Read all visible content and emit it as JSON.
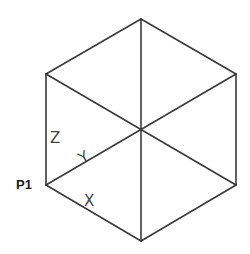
{
  "diagram": {
    "point_label": "P1",
    "axis_labels": {
      "x": "X",
      "y": "Y",
      "z": "Z"
    },
    "line_color": "#3a3a3a",
    "label_color": "#444444"
  }
}
